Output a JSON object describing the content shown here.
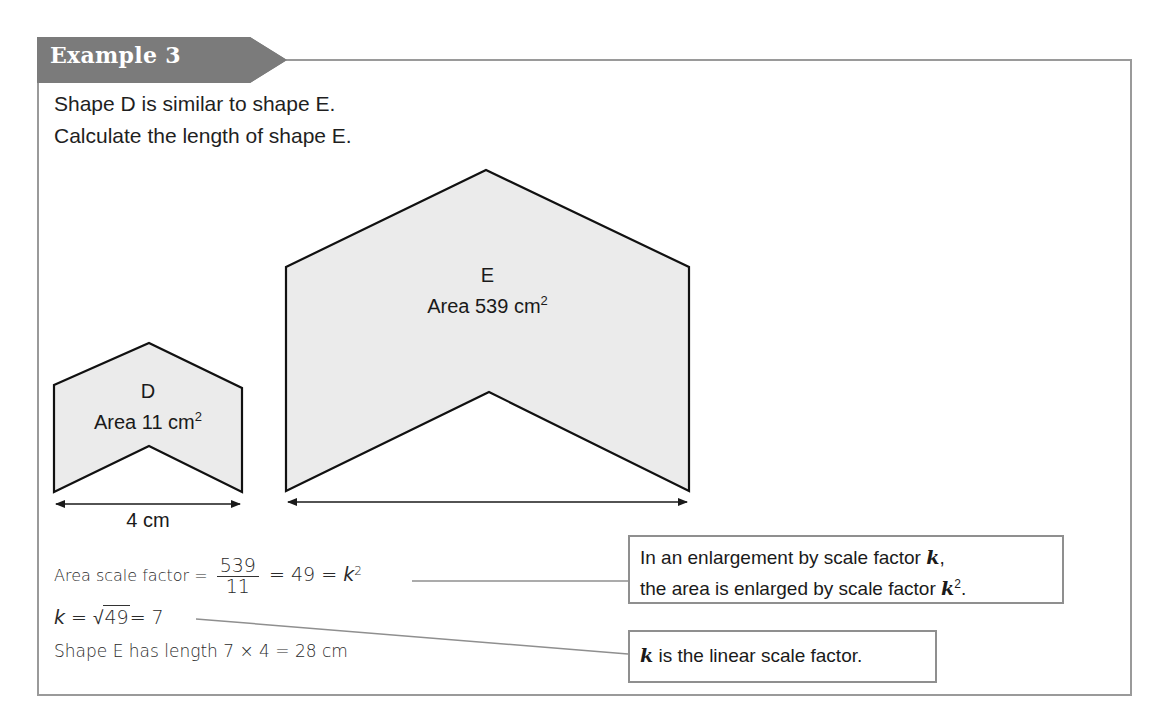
{
  "example": {
    "label": "Example 3",
    "colors": {
      "tab_bg": "#7b7b7b",
      "frame": "#9a9a9a",
      "shape_fill": "#ebebeb",
      "text": "#1a1a1a"
    }
  },
  "question": {
    "line1": "Shape D is similar to shape E.",
    "line2": "Calculate the length of shape E."
  },
  "shapes": {
    "D": {
      "name": "D",
      "area_label": "Area 11 cm",
      "area_sup": "2",
      "width_label": "4 cm"
    },
    "E": {
      "name": "E",
      "area_label": "Area 539 cm",
      "area_sup": "2"
    }
  },
  "solution": {
    "line1_prefix": "Area scale factor = ",
    "frac_num": "539",
    "frac_den": "11",
    "line1_suffix": " = 49 = ",
    "line1_k": "k",
    "line1_sup": "2",
    "line2_k": "k",
    "line2_eq": " = √",
    "line2_rad": "49",
    "line2_result": "= 7",
    "line3": "Shape E has length 7 × 4 = 28 cm"
  },
  "callouts": [
    {
      "line1_text": "In an enlargement by scale factor ",
      "line1_k": "k",
      "line1_end": ",",
      "line2_text": "the area is enlarged by scale factor ",
      "line2_k": "k",
      "line2_sup": "2",
      "line2_end": "."
    },
    {
      "k": "k",
      "text": " is the linear scale factor."
    }
  ]
}
